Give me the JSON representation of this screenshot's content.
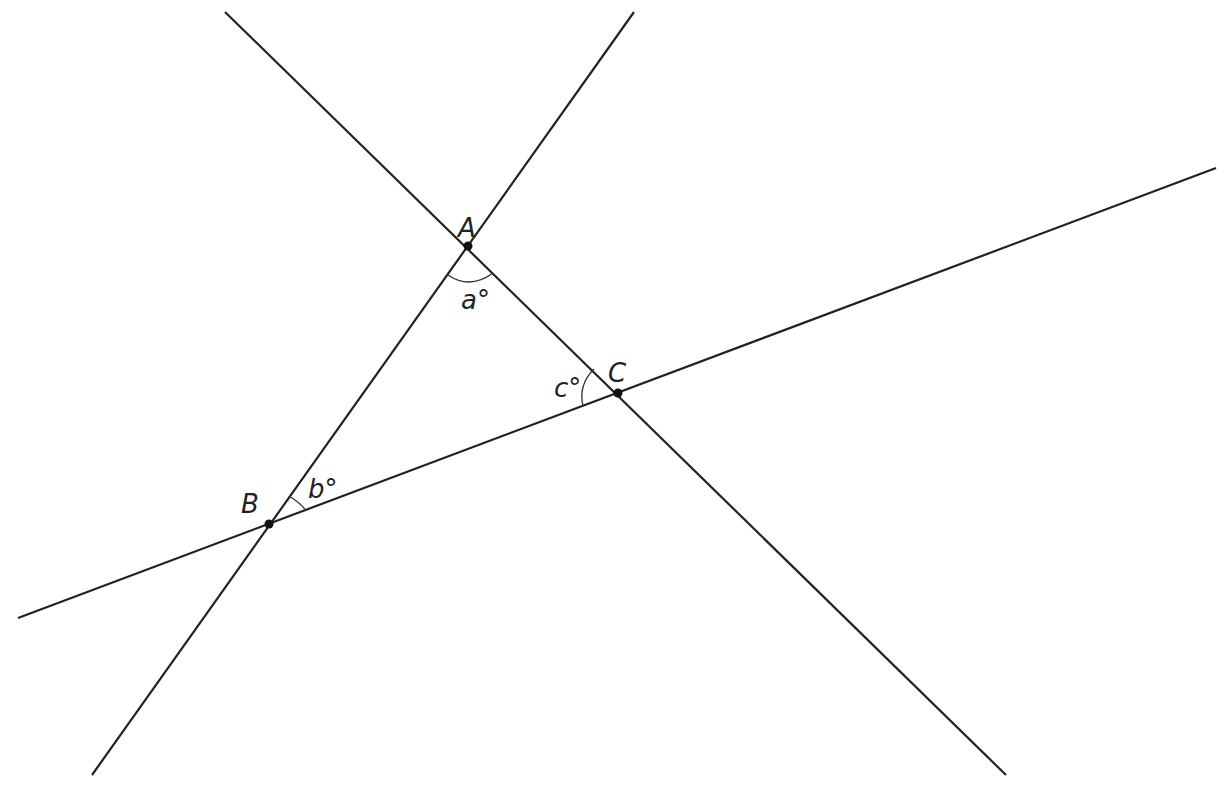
{
  "diagram": {
    "points": [
      {
        "id": "A",
        "label": "A",
        "x": 468,
        "y": 246
      },
      {
        "id": "B",
        "label": "B",
        "x": 269,
        "y": 524
      },
      {
        "id": "C",
        "label": "C",
        "x": 618,
        "y": 393
      }
    ],
    "angles": [
      {
        "vertex": "A",
        "label": "a°"
      },
      {
        "vertex": "B",
        "label": "b°"
      },
      {
        "vertex": "C",
        "label": "c°"
      }
    ],
    "lines": [
      {
        "name": "line-AB",
        "x1": 634,
        "y1": 12,
        "x2": 92,
        "y2": 775
      },
      {
        "name": "line-AC",
        "x1": 225,
        "y1": 12,
        "x2": 1006,
        "y2": 775
      },
      {
        "name": "line-BC",
        "x1": 18,
        "y1": 618,
        "x2": 1216,
        "y2": 168
      }
    ]
  }
}
